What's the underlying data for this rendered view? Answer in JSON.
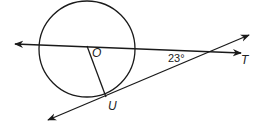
{
  "diagram": {
    "type": "geometry",
    "labels": {
      "center": "O",
      "tangent_point": "U",
      "external_point": "T",
      "angle": "23°"
    },
    "colors": {
      "stroke": "#1a1a1a",
      "background": "#ffffff"
    },
    "geometry": {
      "circle": {
        "cx": 87,
        "cy": 49,
        "r": 48
      },
      "secant_line": {
        "x1": 15,
        "y1": 44,
        "x2": 241,
        "y2": 53
      },
      "tangent_line": {
        "x1": 48,
        "y1": 120,
        "x2": 249,
        "y2": 35
      },
      "radius_OU": {
        "x1": 87,
        "y1": 46,
        "x2": 106,
        "y2": 97
      }
    }
  }
}
